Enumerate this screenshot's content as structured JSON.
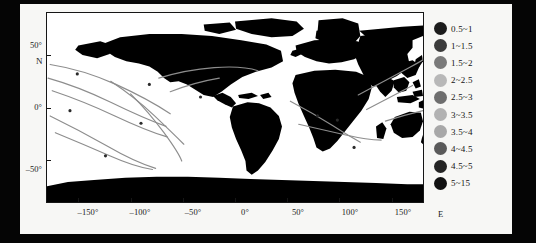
{
  "figure": {
    "type": "world-map-track-plot",
    "background": "#f7f7f5",
    "land_color": "#000000",
    "ocean_color": "#ffffff",
    "track_color": "#8d8d8d"
  },
  "axes": {
    "x_label_suffix": "E",
    "y_label_suffix": "N",
    "x_ticks": [
      {
        "value": -150,
        "label": "–150°"
      },
      {
        "value": -100,
        "label": "–100°"
      },
      {
        "value": -50,
        "label": "–50°"
      },
      {
        "value": 0,
        "label": "0°"
      },
      {
        "value": 50,
        "label": "50°"
      },
      {
        "value": 100,
        "label": "100°"
      },
      {
        "value": 150,
        "label": "150°"
      }
    ],
    "y_ticks": [
      {
        "value": 50,
        "label": "50°"
      },
      {
        "value": 0,
        "label": "0°"
      },
      {
        "value": -50,
        "label": "–50°"
      }
    ],
    "xlim": [
      -180,
      180
    ],
    "ylim": [
      -90,
      90
    ]
  },
  "legend": {
    "position": "right",
    "items": [
      {
        "label": "0.5~1",
        "color": "#1c1c1c"
      },
      {
        "label": "1~1.5",
        "color": "#3b3b3b"
      },
      {
        "label": "1.5~2",
        "color": "#7a7a7a"
      },
      {
        "label": "2~2.5",
        "color": "#b8b8b8"
      },
      {
        "label": "2.5~3",
        "color": "#6e6e6e"
      },
      {
        "label": "3~3.5",
        "color": "#b2b2b2"
      },
      {
        "label": "3.5~4",
        "color": "#a8a8a8"
      },
      {
        "label": "4~4.5",
        "color": "#5a5a5a"
      },
      {
        "label": "4.5~5",
        "color": "#242424"
      },
      {
        "label": "5~15",
        "color": "#111111"
      }
    ]
  },
  "chart_data": {
    "type": "map",
    "title": "",
    "xlabel": "E",
    "ylabel": "N",
    "xlim": [
      -180,
      180
    ],
    "ylim": [
      -90,
      90
    ],
    "grid": false,
    "legend_position": "right",
    "legend_entries": [
      "0.5~1",
      "1~1.5",
      "1.5~2",
      "2~2.5",
      "2.5~3",
      "3~3.5",
      "3.5~4",
      "4~4.5",
      "4.5~5",
      "5~15"
    ],
    "series": [
      {
        "name": "track-np-1",
        "points": [
          [
            -178,
            42
          ],
          [
            -160,
            38
          ],
          [
            -140,
            30
          ],
          [
            -125,
            22
          ],
          [
            -118,
            14
          ]
        ]
      },
      {
        "name": "track-np-2",
        "points": [
          [
            -180,
            30
          ],
          [
            -165,
            25
          ],
          [
            -148,
            17
          ],
          [
            -132,
            9
          ],
          [
            -120,
            2
          ]
        ]
      },
      {
        "name": "track-np-3",
        "points": [
          [
            -178,
            18
          ],
          [
            -162,
            10
          ],
          [
            -145,
            2
          ],
          [
            -128,
            -6
          ],
          [
            -112,
            -12
          ]
        ]
      },
      {
        "name": "track-ep-1",
        "points": [
          [
            -120,
            24
          ],
          [
            -104,
            16
          ],
          [
            -90,
            7
          ],
          [
            -80,
            -2
          ],
          [
            -72,
            -10
          ]
        ]
      },
      {
        "name": "track-ep-2",
        "points": [
          [
            -112,
            10
          ],
          [
            -100,
            2
          ],
          [
            -90,
            -8
          ],
          [
            -82,
            -18
          ],
          [
            -76,
            -28
          ]
        ]
      },
      {
        "name": "track-sp-1",
        "points": [
          [
            -180,
            -8
          ],
          [
            -164,
            -16
          ],
          [
            -146,
            -26
          ],
          [
            -128,
            -34
          ],
          [
            -112,
            -40
          ]
        ]
      },
      {
        "name": "track-sp-2",
        "points": [
          [
            -176,
            -24
          ],
          [
            -158,
            -32
          ],
          [
            -140,
            -40
          ],
          [
            -124,
            -46
          ]
        ]
      },
      {
        "name": "track-natl-1",
        "points": [
          [
            -80,
            24
          ],
          [
            -62,
            28
          ],
          [
            -44,
            32
          ],
          [
            -26,
            34
          ],
          [
            -8,
            33
          ]
        ]
      },
      {
        "name": "track-natl-2",
        "points": [
          [
            -72,
            14
          ],
          [
            -54,
            20
          ],
          [
            -36,
            26
          ],
          [
            -18,
            30
          ]
        ]
      },
      {
        "name": "track-io-1",
        "points": [
          [
            52,
            -6
          ],
          [
            68,
            -14
          ],
          [
            82,
            -22
          ],
          [
            96,
            -28
          ]
        ]
      },
      {
        "name": "track-io-2",
        "points": [
          [
            60,
            -22
          ],
          [
            78,
            -26
          ],
          [
            96,
            -30
          ],
          [
            112,
            -32
          ]
        ]
      },
      {
        "name": "track-wp-1",
        "points": [
          [
            118,
            8
          ],
          [
            134,
            18
          ],
          [
            150,
            28
          ],
          [
            166,
            36
          ],
          [
            180,
            42
          ]
        ]
      },
      {
        "name": "track-wp-2",
        "points": [
          [
            126,
            -4
          ],
          [
            142,
            2
          ],
          [
            158,
            10
          ],
          [
            174,
            18
          ]
        ]
      },
      {
        "name": "track-wp-3",
        "points": [
          [
            140,
            -20
          ],
          [
            156,
            -26
          ],
          [
            172,
            -30
          ],
          [
            180,
            -32
          ]
        ]
      }
    ]
  }
}
